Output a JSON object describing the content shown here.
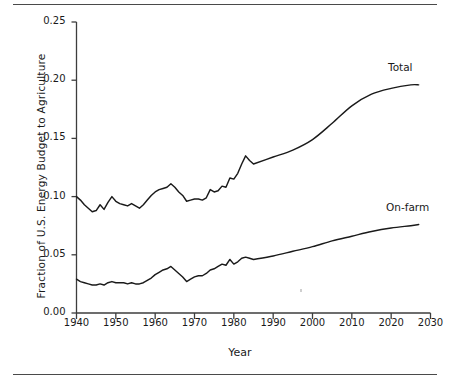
{
  "figure": {
    "has_top_rule": true,
    "has_bottom_rule": true,
    "background": "#ffffff",
    "line_color": "#1a1a1a",
    "axis_color": "#3d3d3d"
  },
  "axis_titles": {
    "y": "Fraction of U.S. Energy Budget to Agriculture",
    "x": "Year"
  },
  "ticks": {
    "y": [
      "0.25",
      "0.20",
      "0.15",
      "0.10",
      "0.05",
      "0.00"
    ],
    "x": [
      "1940",
      "1950",
      "1960",
      "1970",
      "1980",
      "1990",
      "2000",
      "2010",
      "2020",
      "2030"
    ]
  },
  "series_labels": {
    "total": "Total",
    "onfarm": "On-farm"
  },
  "chart_data": {
    "type": "line",
    "title": "",
    "xlabel": "Year",
    "ylabel": "Fraction of U.S. Energy Budget to Agriculture",
    "xlim": [
      1940,
      2030
    ],
    "ylim": [
      0.0,
      0.25
    ],
    "xticks": [
      1940,
      1950,
      1960,
      1970,
      1980,
      1990,
      2000,
      2010,
      2020,
      2030
    ],
    "yticks": [
      0.0,
      0.05,
      0.1,
      0.15,
      0.2,
      0.25
    ],
    "grid": false,
    "legend": "inline-right-end-labels",
    "series": [
      {
        "name": "Total",
        "label_position": "right-end",
        "x": [
          1940,
          1941,
          1942,
          1943,
          1944,
          1945,
          1946,
          1947,
          1948,
          1949,
          1950,
          1951,
          1952,
          1953,
          1954,
          1955,
          1956,
          1957,
          1958,
          1959,
          1960,
          1961,
          1962,
          1963,
          1964,
          1965,
          1966,
          1967,
          1968,
          1969,
          1970,
          1971,
          1972,
          1973,
          1974,
          1975,
          1976,
          1977,
          1978,
          1979,
          1980,
          1981,
          1982,
          1983,
          1984,
          1985,
          1990,
          1995,
          2000,
          2005,
          2010,
          2015,
          2020,
          2025,
          2027
        ],
        "values": [
          0.1,
          0.097,
          0.093,
          0.09,
          0.087,
          0.088,
          0.093,
          0.089,
          0.095,
          0.1,
          0.096,
          0.094,
          0.093,
          0.092,
          0.094,
          0.092,
          0.09,
          0.093,
          0.097,
          0.101,
          0.104,
          0.106,
          0.107,
          0.108,
          0.111,
          0.108,
          0.104,
          0.101,
          0.096,
          0.097,
          0.098,
          0.098,
          0.097,
          0.099,
          0.106,
          0.104,
          0.105,
          0.109,
          0.108,
          0.116,
          0.115,
          0.12,
          0.128,
          0.135,
          0.131,
          0.128,
          0.134,
          0.14,
          0.149,
          0.163,
          0.178,
          0.188,
          0.193,
          0.196,
          0.196
        ]
      },
      {
        "name": "On-farm",
        "label_position": "right-end",
        "x": [
          1940,
          1941,
          1942,
          1943,
          1944,
          1945,
          1946,
          1947,
          1948,
          1949,
          1950,
          1951,
          1952,
          1953,
          1954,
          1955,
          1956,
          1957,
          1958,
          1959,
          1960,
          1961,
          1962,
          1963,
          1964,
          1965,
          1966,
          1967,
          1968,
          1969,
          1970,
          1971,
          1972,
          1973,
          1974,
          1975,
          1976,
          1977,
          1978,
          1979,
          1980,
          1981,
          1982,
          1983,
          1984,
          1985,
          1990,
          1995,
          2000,
          2005,
          2010,
          2015,
          2020,
          2025,
          2027
        ],
        "values": [
          0.029,
          0.027,
          0.026,
          0.025,
          0.024,
          0.024,
          0.025,
          0.024,
          0.026,
          0.027,
          0.026,
          0.026,
          0.026,
          0.025,
          0.026,
          0.025,
          0.025,
          0.026,
          0.028,
          0.03,
          0.033,
          0.035,
          0.037,
          0.038,
          0.04,
          0.037,
          0.034,
          0.031,
          0.027,
          0.029,
          0.031,
          0.032,
          0.032,
          0.034,
          0.037,
          0.038,
          0.04,
          0.042,
          0.041,
          0.046,
          0.042,
          0.044,
          0.047,
          0.048,
          0.047,
          0.046,
          0.049,
          0.053,
          0.057,
          0.062,
          0.066,
          0.07,
          0.073,
          0.075,
          0.076
        ]
      }
    ]
  }
}
